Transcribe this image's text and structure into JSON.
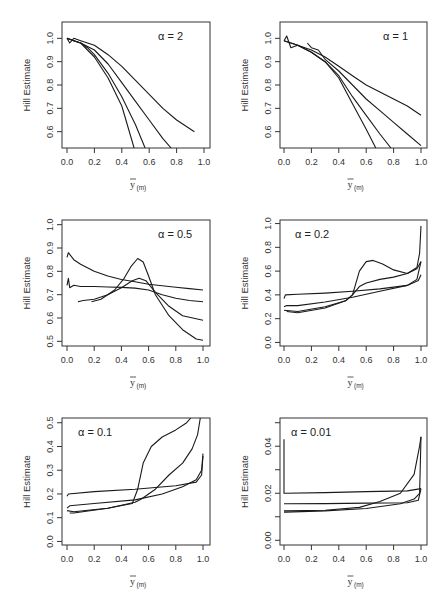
{
  "chart_data": [
    {
      "type": "line",
      "panel": "top-left",
      "annotation": "α = 2",
      "ylabel": "Hill Estimate",
      "xlabel": "ȳ(m)",
      "xlim": [
        0,
        1.0
      ],
      "ylim": [
        0.53,
        1.07
      ],
      "xticks": [
        "0.0",
        "0.2",
        "0.4",
        "0.6",
        "0.8",
        "1.0"
      ],
      "yticks": [
        "0.6",
        "0.7",
        "0.8",
        "0.9",
        "1.0"
      ],
      "series": [
        {
          "name": "curve-1",
          "x": [
            0.0,
            0.02,
            0.05,
            0.1,
            0.2,
            0.3,
            0.4,
            0.5,
            0.6,
            0.7,
            0.8,
            0.93
          ],
          "y": [
            1.0,
            0.98,
            1.0,
            0.99,
            0.97,
            0.93,
            0.88,
            0.82,
            0.76,
            0.7,
            0.65,
            0.6
          ]
        },
        {
          "name": "curve-2",
          "x": [
            0.0,
            0.05,
            0.1,
            0.2,
            0.3,
            0.4,
            0.5,
            0.6,
            0.7,
            0.76
          ],
          "y": [
            1.0,
            0.99,
            0.98,
            0.95,
            0.89,
            0.81,
            0.73,
            0.65,
            0.57,
            0.53
          ]
        },
        {
          "name": "curve-3",
          "x": [
            0.0,
            0.05,
            0.1,
            0.15,
            0.2,
            0.3,
            0.4,
            0.5,
            0.57
          ],
          "y": [
            1.0,
            0.99,
            0.98,
            0.96,
            0.93,
            0.85,
            0.75,
            0.63,
            0.53
          ]
        },
        {
          "name": "curve-4",
          "x": [
            0.0,
            0.05,
            0.1,
            0.15,
            0.2,
            0.3,
            0.4,
            0.49
          ],
          "y": [
            1.0,
            0.99,
            0.98,
            0.95,
            0.92,
            0.83,
            0.71,
            0.53
          ]
        }
      ]
    },
    {
      "type": "line",
      "panel": "top-right",
      "annotation": "α = 1",
      "ylabel": "Hill Estimate",
      "xlabel": "ȳ(m)",
      "xlim": [
        0,
        1.0
      ],
      "ylim": [
        0.53,
        1.07
      ],
      "xticks": [
        "0.0",
        "0.2",
        "0.4",
        "0.6",
        "0.8",
        "1.0"
      ],
      "yticks": [
        "0.6",
        "0.7",
        "0.8",
        "0.9",
        "1.0"
      ],
      "series": [
        {
          "name": "curve-1",
          "x": [
            0.0,
            0.02,
            0.05,
            0.1,
            0.2,
            0.3,
            0.4,
            0.5,
            0.6,
            0.7,
            0.8,
            0.9,
            1.0
          ],
          "y": [
            0.99,
            1.01,
            0.96,
            0.97,
            0.95,
            0.92,
            0.88,
            0.84,
            0.8,
            0.77,
            0.74,
            0.71,
            0.67
          ]
        },
        {
          "name": "curve-2",
          "x": [
            0.17,
            0.2,
            0.25,
            0.3,
            0.4,
            0.5,
            0.6,
            0.7,
            0.8,
            0.9,
            1.0
          ],
          "y": [
            0.98,
            0.96,
            0.95,
            0.91,
            0.86,
            0.8,
            0.74,
            0.69,
            0.64,
            0.59,
            0.54
          ]
        },
        {
          "name": "curve-3",
          "x": [
            0.0,
            0.1,
            0.2,
            0.3,
            0.4,
            0.5,
            0.6,
            0.7,
            0.78
          ],
          "y": [
            0.99,
            0.97,
            0.94,
            0.9,
            0.84,
            0.75,
            0.67,
            0.59,
            0.53
          ]
        },
        {
          "name": "curve-4",
          "x": [
            0.0,
            0.1,
            0.2,
            0.3,
            0.4,
            0.5,
            0.6,
            0.67
          ],
          "y": [
            0.99,
            0.97,
            0.94,
            0.9,
            0.83,
            0.72,
            0.61,
            0.53
          ]
        }
      ]
    },
    {
      "type": "line",
      "panel": "middle-left",
      "annotation": "α = 0.5",
      "ylabel": "Hill Estimate",
      "xlabel": "ȳ(m)",
      "xlim": [
        0,
        1.0
      ],
      "ylim": [
        0.48,
        1.02
      ],
      "xticks": [
        "0.0",
        "0.2",
        "0.4",
        "0.6",
        "0.8",
        "1.0"
      ],
      "yticks": [
        "0.5",
        "0.6",
        "0.7",
        "0.8",
        "0.9",
        "1.0"
      ],
      "series": [
        {
          "name": "curve-1",
          "x": [
            0.0,
            0.01,
            0.05,
            0.1,
            0.2,
            0.3,
            0.4,
            0.5,
            0.6,
            0.7,
            0.8,
            0.9,
            1.0
          ],
          "y": [
            0.86,
            0.88,
            0.85,
            0.83,
            0.8,
            0.78,
            0.765,
            0.755,
            0.745,
            0.738,
            0.732,
            0.726,
            0.72
          ]
        },
        {
          "name": "curve-2",
          "x": [
            0.0,
            0.01,
            0.02,
            0.05,
            0.1,
            0.2,
            0.3,
            0.4,
            0.5,
            0.6,
            0.7,
            0.8,
            0.9,
            1.0
          ],
          "y": [
            0.74,
            0.77,
            0.73,
            0.74,
            0.735,
            0.735,
            0.733,
            0.731,
            0.728,
            0.72,
            0.7,
            0.685,
            0.675,
            0.67
          ]
        },
        {
          "name": "curve-3",
          "x": [
            0.08,
            0.12,
            0.2,
            0.3,
            0.4,
            0.48,
            0.53,
            0.58,
            0.65,
            0.75,
            0.85,
            1.0
          ],
          "y": [
            0.67,
            0.675,
            0.68,
            0.7,
            0.73,
            0.76,
            0.77,
            0.76,
            0.71,
            0.65,
            0.61,
            0.59
          ]
        },
        {
          "name": "curve-4",
          "x": [
            0.18,
            0.25,
            0.35,
            0.42,
            0.47,
            0.52,
            0.56,
            0.6,
            0.65,
            0.75,
            0.85,
            0.95,
            1.0
          ],
          "y": [
            0.67,
            0.68,
            0.72,
            0.77,
            0.82,
            0.855,
            0.84,
            0.78,
            0.7,
            0.61,
            0.55,
            0.51,
            0.505
          ]
        }
      ]
    },
    {
      "type": "line",
      "panel": "middle-right",
      "annotation": "α = 0.2",
      "ylabel": "Hill Estimate",
      "xlabel": "ȳ(m)",
      "xlim": [
        0,
        1.0
      ],
      "ylim": [
        -0.03,
        1.03
      ],
      "xticks": [
        "0.0",
        "0.2",
        "0.4",
        "0.6",
        "0.8",
        "1.0"
      ],
      "yticks": [
        "0.0",
        "0.2",
        "0.4",
        "0.6",
        "0.8",
        "1.0"
      ],
      "series": [
        {
          "name": "curve-1",
          "x": [
            0.0,
            0.01,
            0.1,
            0.3,
            0.5,
            0.7,
            0.9,
            0.98,
            1.0
          ],
          "y": [
            0.37,
            0.4,
            0.405,
            0.415,
            0.43,
            0.45,
            0.48,
            0.52,
            0.57
          ]
        },
        {
          "name": "curve-2",
          "x": [
            0.0,
            0.02,
            0.1,
            0.3,
            0.5,
            0.7,
            0.9,
            0.97,
            1.0
          ],
          "y": [
            0.3,
            0.31,
            0.31,
            0.34,
            0.38,
            0.43,
            0.48,
            0.53,
            0.68
          ]
        },
        {
          "name": "curve-3",
          "x": [
            0.0,
            0.1,
            0.3,
            0.45,
            0.5,
            0.55,
            0.6,
            0.7,
            0.8,
            0.9,
            0.97,
            1.0
          ],
          "y": [
            0.27,
            0.26,
            0.3,
            0.35,
            0.4,
            0.47,
            0.5,
            0.53,
            0.55,
            0.58,
            0.62,
            0.68
          ]
        },
        {
          "name": "curve-4",
          "x": [
            0.02,
            0.1,
            0.3,
            0.45,
            0.5,
            0.55,
            0.6,
            0.65,
            0.72,
            0.8,
            0.9,
            0.97,
            0.99,
            1.0
          ],
          "y": [
            0.26,
            0.25,
            0.29,
            0.35,
            0.4,
            0.6,
            0.68,
            0.69,
            0.66,
            0.61,
            0.58,
            0.63,
            0.75,
            0.98
          ]
        }
      ]
    },
    {
      "type": "line",
      "panel": "bottom-left",
      "annotation": "α = 0.1",
      "ylabel": "Hill Estimate",
      "xlabel": "ȳ(m)",
      "xlim": [
        0,
        1.0
      ],
      "ylim": [
        -0.015,
        0.52
      ],
      "xticks": [
        "0.0",
        "0.2",
        "0.4",
        "0.6",
        "0.8",
        "1.0"
      ],
      "yticks": [
        "0.0",
        "0.1",
        "0.2",
        "0.3",
        "0.4",
        "0.5"
      ],
      "series": [
        {
          "name": "curve-1",
          "x": [
            0.0,
            0.01,
            0.2,
            0.5,
            0.8,
            0.95,
            0.99,
            1.0
          ],
          "y": [
            0.19,
            0.2,
            0.21,
            0.22,
            0.235,
            0.25,
            0.28,
            0.36
          ]
        },
        {
          "name": "curve-2",
          "x": [
            0.0,
            0.02,
            0.2,
            0.5,
            0.7,
            0.85,
            0.95,
            0.99,
            1.0
          ],
          "y": [
            0.14,
            0.15,
            0.16,
            0.175,
            0.2,
            0.23,
            0.26,
            0.3,
            0.37
          ]
        },
        {
          "name": "curve-3",
          "x": [
            0.0,
            0.05,
            0.3,
            0.5,
            0.55,
            0.65,
            0.75,
            0.85,
            0.92,
            0.96,
            0.98
          ],
          "y": [
            0.13,
            0.125,
            0.14,
            0.165,
            0.18,
            0.22,
            0.28,
            0.33,
            0.39,
            0.45,
            0.52
          ]
        },
        {
          "name": "curve-4",
          "x": [
            0.02,
            0.05,
            0.3,
            0.48,
            0.52,
            0.56,
            0.62,
            0.7,
            0.8,
            0.88,
            0.91
          ],
          "y": [
            0.12,
            0.12,
            0.14,
            0.16,
            0.22,
            0.33,
            0.4,
            0.44,
            0.47,
            0.5,
            0.52
          ]
        }
      ]
    },
    {
      "type": "line",
      "panel": "bottom-right",
      "annotation": "α = 0.01",
      "ylabel": "Hill Estimate",
      "xlabel": "ȳ(m)",
      "xlim": [
        0,
        1.0
      ],
      "ylim": [
        -0.002,
        0.052
      ],
      "xticks": [
        "0.0",
        "0.2",
        "0.4",
        "0.6",
        "0.8",
        "1.0"
      ],
      "yticks": [
        "0.00",
        "0.02",
        "0.04"
      ],
      "series": [
        {
          "name": "curve-1",
          "x": [
            0.0,
            0.0,
            0.01,
            0.3,
            0.6,
            0.9,
            1.0
          ],
          "y": [
            0.043,
            0.02,
            0.02,
            0.0203,
            0.0207,
            0.021,
            0.022
          ]
        },
        {
          "name": "curve-2",
          "x": [
            0.0,
            0.01,
            0.3,
            0.6,
            0.9,
            0.98,
            1.0
          ],
          "y": [
            0.0155,
            0.0155,
            0.0156,
            0.0158,
            0.016,
            0.017,
            0.022
          ]
        },
        {
          "name": "curve-3",
          "x": [
            0.0,
            0.01,
            0.3,
            0.55,
            0.7,
            0.85,
            0.95,
            0.99,
            1.0
          ],
          "y": [
            0.0125,
            0.0125,
            0.0128,
            0.014,
            0.0165,
            0.02,
            0.028,
            0.04,
            0.044
          ]
        },
        {
          "name": "curve-4",
          "x": [
            0.0,
            0.01,
            0.3,
            0.6,
            0.85,
            0.95,
            0.99,
            1.0
          ],
          "y": [
            0.012,
            0.012,
            0.0125,
            0.0135,
            0.0155,
            0.0175,
            0.02,
            0.044
          ]
        }
      ]
    }
  ]
}
